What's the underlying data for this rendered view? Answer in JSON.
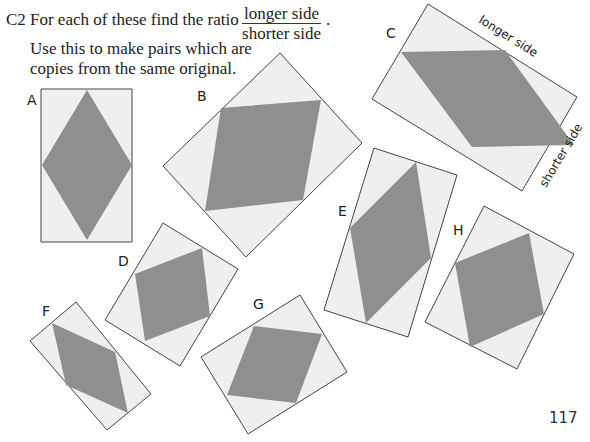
{
  "question": {
    "number": "C2",
    "prompt": "For each of these find the ratio",
    "ratio_numerator": "longer side",
    "ratio_denominator": "shorter side",
    "end_punct": ".",
    "instruction_line1": "Use this to make pairs which are",
    "instruction_line2": "copies from the same original."
  },
  "colors": {
    "rect_fill": "#efefef",
    "rect_stroke": "#444444",
    "rhombus_fill": "#8f8f8f"
  },
  "shapes": [
    {
      "label": "A",
      "label_pos": [
        27,
        105
      ],
      "rect": "41,89 132,89 132,242 41,242",
      "rhombus": "87,90 132,165 87,240 42,165"
    },
    {
      "label": "B",
      "label_pos": [
        197,
        101
      ],
      "rect": "280,53 362,143 246,257 163,166",
      "rhombus": "221,108 321,100 303,200 205,211"
    },
    {
      "label": "C",
      "label_pos": [
        386,
        38
      ],
      "rect": "428,4 577,97 522,191 372,99",
      "rhombus": "401,52 505,50 574,145 472,147"
    },
    {
      "label": "D",
      "label_pos": [
        118,
        266
      ],
      "rect": "163,223 238,269 180,366 105,320",
      "rhombus": "202,248 210,316 145,341 135,274"
    },
    {
      "label": "E",
      "label_pos": [
        338,
        216
      ],
      "rect": "374,148 457,175 408,337 324,310",
      "rhombus": "416,162 431,258 366,323 350,228"
    },
    {
      "label": "F",
      "label_pos": [
        42,
        316
      ],
      "rect": "76,302 151,394 107,430 30,341",
      "rhombus": "52,323 115,352 128,413 66,385"
    },
    {
      "label": "G",
      "label_pos": [
        253,
        309
      ],
      "rect": "300,295 347,372 248,434 201,357",
      "rhombus": "254,326 322,334 296,403 227,395"
    },
    {
      "label": "H",
      "label_pos": [
        453,
        235
      ],
      "rect": "484,206 574,254 517,369 425,322",
      "rhombus": "529,233 544,314 470,347 455,263"
    }
  ],
  "annotations": {
    "longer_side": "longer side",
    "shorter_side": "shorter side"
  },
  "page_number": "117"
}
